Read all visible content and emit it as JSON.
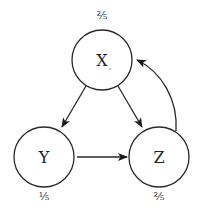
{
  "diagram": {
    "type": "directed-graph",
    "nodes": [
      {
        "id": "X",
        "label": "X",
        "probability": "⅖",
        "cx": 102,
        "cy": 60,
        "r": 30
      },
      {
        "id": "Y",
        "label": "Y",
        "probability": "⅕",
        "cx": 44,
        "cy": 157,
        "r": 30
      },
      {
        "id": "Z",
        "label": "Z",
        "probability": "⅖",
        "cx": 159,
        "cy": 157,
        "r": 30
      }
    ],
    "edges": [
      {
        "from": "X",
        "to": "Y"
      },
      {
        "from": "X",
        "to": "Z"
      },
      {
        "from": "Y",
        "to": "Z"
      },
      {
        "from": "Z",
        "to": "X",
        "curved": true
      }
    ],
    "colors": {
      "stroke": "#2a2a2a",
      "background": "#ffffff"
    }
  }
}
